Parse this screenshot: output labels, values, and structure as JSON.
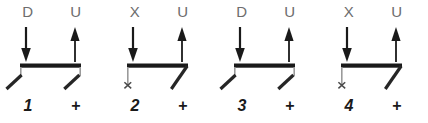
{
  "figure": {
    "background_color": "#ffffff",
    "beam_color": "#1a1a1a",
    "leg_color": "#262626",
    "stub_color": "#9a9a9a",
    "arrow_color": "#1a1a1a",
    "top_label_color": "#6d6d6d",
    "bottom_label_color": "#1a1a1a",
    "panel_count": 4
  },
  "panels": [
    {
      "number": "1",
      "sign": "+",
      "top_left_label": "D",
      "top_right_label": "U",
      "left_arrow": "down-arrow",
      "right_arrow": "up-arrow",
      "left_support": "angled-leg",
      "right_support": "angled-leg",
      "left_support_mark": "",
      "beam": "rigid-beam"
    },
    {
      "number": "2",
      "sign": "+",
      "top_left_label": "X",
      "top_right_label": "U",
      "left_arrow": "down-arrow",
      "right_arrow": "up-arrow",
      "left_support": "vertical-stub-cross",
      "right_support": "angled-leg",
      "left_support_mark": "×",
      "beam": "rigid-beam"
    },
    {
      "number": "3",
      "sign": "+",
      "top_left_label": "D",
      "top_right_label": "U",
      "left_arrow": "down-arrow",
      "right_arrow": "up-arrow",
      "left_support": "angled-leg",
      "right_support": "angled-leg",
      "left_support_mark": "",
      "beam": "rigid-beam"
    },
    {
      "number": "4",
      "sign": "+",
      "top_left_label": "X",
      "top_right_label": "U",
      "left_arrow": "down-arrow",
      "right_arrow": "up-arrow",
      "left_support": "vertical-stub-cross",
      "right_support": "angled-leg",
      "left_support_mark": "×",
      "beam": "rigid-beam"
    }
  ]
}
